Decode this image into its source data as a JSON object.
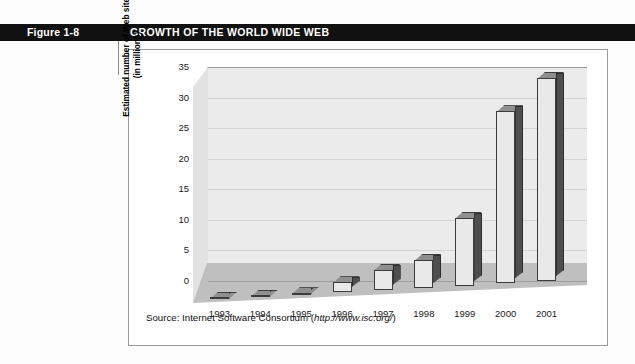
{
  "figure": {
    "label": "Figure 1-8",
    "title": "GROWTH OF THE WORLD WIDE WEB"
  },
  "source": {
    "prefix": "Source: Internet Software Consortium (",
    "url": "http://www.isc.org/",
    "suffix": ")"
  },
  "colors": {
    "header_band": "#111111",
    "header_text": "#ffffff",
    "plot_back_wall": "#ebebeb",
    "plot_floor": "#bfbfbf",
    "bar_face": "#e9e9e9",
    "bar_side": "#4e4e4e",
    "bar_top": "#8f8f8f",
    "frame_border": "#9a9a9a"
  },
  "chart_data": {
    "type": "bar",
    "title": "GROWTH OF THE WORLD WIDE WEB",
    "subtitle": "",
    "xlabel": "",
    "ylabel": "Estimated number of Web sites (in millions)",
    "ylabel_lines": [
      "Estimated number of Web sites",
      "(in millions)"
    ],
    "categories": [
      "1993",
      "1994",
      "1995",
      "1996",
      "1997",
      "1998",
      "1999",
      "2000",
      "2001"
    ],
    "values": [
      0.1,
      0.2,
      0.3,
      1.6,
      3.3,
      4.6,
      11.2,
      28.1,
      33.2
    ],
    "ylim": [
      0,
      35
    ],
    "ytick_labels": [
      "0",
      "5",
      "10",
      "15",
      "20",
      "25",
      "30",
      "35"
    ],
    "ytick_values": [
      0,
      5,
      10,
      15,
      20,
      25,
      30,
      35
    ],
    "grid": true,
    "legend": "none",
    "three_d": true,
    "annotations": []
  }
}
